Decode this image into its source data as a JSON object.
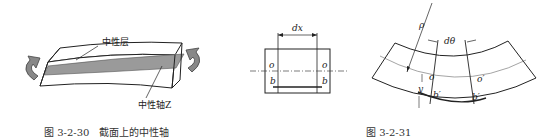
{
  "figures": [
    {
      "caption_number": "图 3-2-30",
      "caption_title": "截面上的中性轴",
      "labels": {
        "neutral_layer": "中性层",
        "neutral_axis": "中性轴Z"
      }
    },
    {
      "labels": {
        "dx": "dx",
        "o_left": "o",
        "o_right": "o",
        "b_left": "b",
        "b_right": "b"
      }
    },
    {
      "caption_number": "图 3-2-31",
      "labels": {
        "rho": "ρ",
        "dtheta": "dθ",
        "o": "o",
        "o_prime": "o′",
        "b_prime_left": "b′",
        "b_prime_right": "b′",
        "y": "y"
      }
    }
  ]
}
